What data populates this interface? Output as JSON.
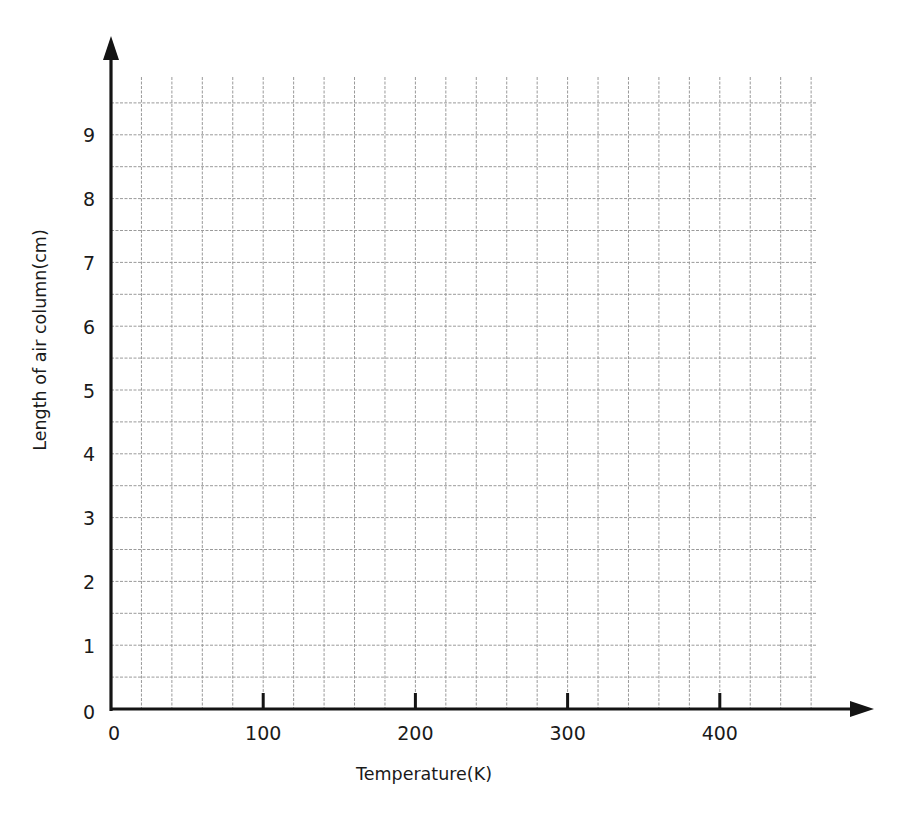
{
  "chart_data": {
    "type": "line",
    "title": "",
    "xlabel": "Temperature(K)",
    "ylabel": "Length of air column(cm)",
    "xlim": [
      0,
      460
    ],
    "ylim": [
      0,
      9.5
    ],
    "x_ticks": [
      0,
      100,
      200,
      300,
      400
    ],
    "x_tick_labels": [
      "0",
      "100",
      "200",
      "300",
      "400"
    ],
    "y_ticks": [
      0,
      1,
      2,
      3,
      4,
      5,
      6,
      7,
      8,
      9
    ],
    "y_tick_labels": [
      "0",
      "1",
      "2",
      "3",
      "4",
      "5",
      "6",
      "7",
      "8",
      "9"
    ],
    "x_minor_step": 20,
    "y_minor_step": 0.5,
    "grid": true,
    "legend": "none",
    "series": []
  }
}
